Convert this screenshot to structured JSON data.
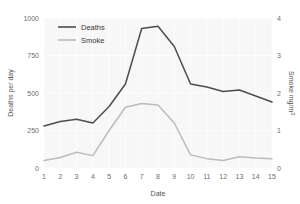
{
  "chart_data": {
    "type": "line",
    "title": "",
    "xlabel": "Date",
    "ylabel": "Deaths per day",
    "y2label": "Smoke mg/m3",
    "x": [
      1,
      2,
      3,
      4,
      5,
      6,
      7,
      8,
      9,
      10,
      11,
      12,
      13,
      14,
      15
    ],
    "xticklabels": [
      "1",
      "2",
      "3",
      "4",
      "5",
      "6",
      "7",
      "8",
      "9",
      "10",
      "11",
      "12",
      "13",
      "14",
      "15"
    ],
    "yticklabels": [
      "0",
      "250",
      "500",
      "750",
      "1000"
    ],
    "yticks": [
      0,
      250,
      500,
      750,
      1000
    ],
    "ylim": [
      0,
      1000
    ],
    "y2ticklabels": [
      "0",
      "1",
      "2",
      "3",
      "4"
    ],
    "y2ticks": [
      0,
      1,
      2,
      3,
      4
    ],
    "y2lim": [
      0,
      4
    ],
    "xlim": [
      1,
      15
    ],
    "grid": true,
    "legend_position": "top-left",
    "series": [
      {
        "name": "Deaths",
        "axis": "left",
        "color": "#4d4d4d",
        "values": [
          280,
          310,
          325,
          300,
          410,
          560,
          930,
          945,
          810,
          560,
          540,
          510,
          520,
          480,
          440
        ]
      },
      {
        "name": "Smoke",
        "axis": "right",
        "color": "#bcbcbc",
        "values": [
          0.2,
          0.28,
          0.42,
          0.33,
          1.0,
          1.62,
          1.72,
          1.68,
          1.2,
          0.35,
          0.25,
          0.2,
          0.3,
          0.27,
          0.25
        ]
      }
    ]
  },
  "legend": {
    "items": [
      {
        "label": "Deaths",
        "color": "#4d4d4d"
      },
      {
        "label": "Smoke",
        "color": "#bcbcbc"
      }
    ]
  },
  "colors": {
    "deaths": "#4d4d4d",
    "smoke": "#bcbcbc",
    "panel_background": "#f7f7f7",
    "gridline": "#ffffff",
    "tick_text": "#6e6e6e",
    "axis_title": "#555555",
    "page_background": "#ffffff"
  }
}
